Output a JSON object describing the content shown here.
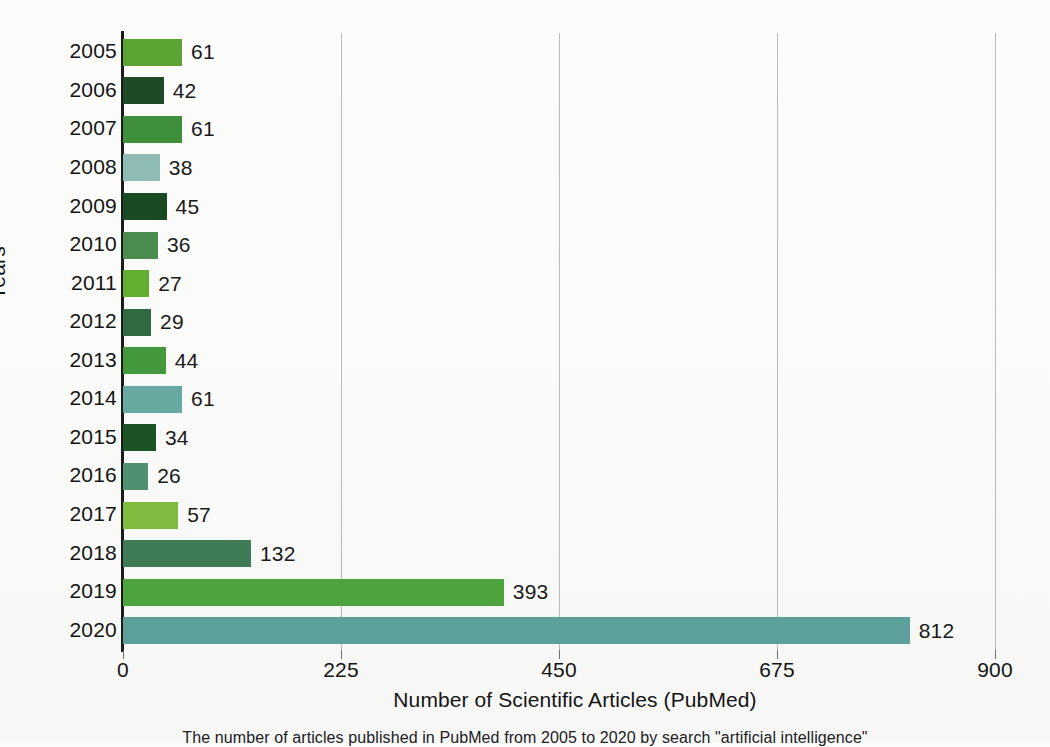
{
  "chart_data": {
    "type": "bar",
    "orientation": "horizontal",
    "title": "",
    "xlabel": "Number of Scientific Articles (PubMed)",
    "ylabel": "Years",
    "categories": [
      "2005",
      "2006",
      "2007",
      "2008",
      "2009",
      "2010",
      "2011",
      "2012",
      "2013",
      "2014",
      "2015",
      "2016",
      "2017",
      "2018",
      "2019",
      "2020"
    ],
    "values": [
      61,
      42,
      61,
      38,
      45,
      36,
      27,
      29,
      44,
      61,
      34,
      26,
      57,
      132,
      393,
      812
    ],
    "bar_colors": [
      "#5aa434",
      "#1f4a28",
      "#3f8f3c",
      "#8ebcb4",
      "#194a23",
      "#4d8c4f",
      "#63ad30",
      "#2f6a42",
      "#45993d",
      "#67a8a0",
      "#1c5326",
      "#4f9070",
      "#7fbb3f",
      "#3e7b56",
      "#4da33c",
      "#5d9f9a"
    ],
    "xlim": [
      0,
      900
    ],
    "xticks": [
      0,
      225,
      450,
      675,
      900
    ],
    "xtick_labels": [
      "0",
      "225",
      "450",
      "675",
      "900"
    ],
    "grid": "vertical",
    "legend": "none",
    "data_labels": [
      "61",
      "42",
      "61",
      "38",
      "45",
      "36",
      "27",
      "29",
      "44",
      "61",
      "34",
      "26",
      "57",
      "132",
      "393",
      "812"
    ]
  },
  "axes": {
    "y_title": "Years",
    "x_title": "Number of Scientific Articles (PubMed)"
  },
  "caption": {
    "text": "The number of articles published in PubMed from 2005 to 2020 by search \"artificial intelligence\""
  }
}
